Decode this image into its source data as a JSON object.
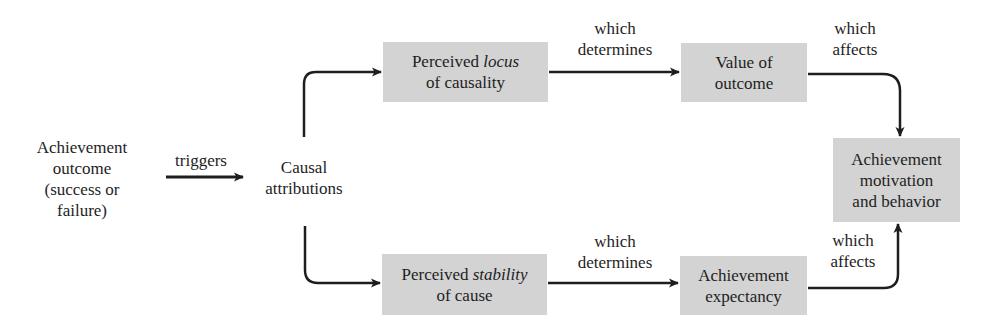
{
  "diagram": {
    "nodes": {
      "outcome": {
        "lines": [
          "Achievement",
          "outcome",
          "(success or",
          "failure)"
        ]
      },
      "attributions": {
        "lines": [
          "Causal",
          "attributions"
        ]
      },
      "locus": {
        "line1_prefix": "Perceived ",
        "line1_italic": "locus",
        "line2": "of causality"
      },
      "value": {
        "lines": [
          "Value of",
          "outcome"
        ]
      },
      "motivation": {
        "lines": [
          "Achievement",
          "motivation",
          "and behavior"
        ]
      },
      "stability": {
        "line1_prefix": "Perceived ",
        "line1_italic": "stability",
        "line2": "of cause"
      },
      "expectancy": {
        "lines": [
          "Achievement",
          "expectancy"
        ]
      }
    },
    "edges": {
      "triggers": "triggers",
      "top_determines": [
        "which",
        "determines"
      ],
      "top_affects": [
        "which",
        "affects"
      ],
      "bottom_determines": [
        "which",
        "determines"
      ],
      "bottom_affects": [
        "which",
        "affects"
      ]
    },
    "colors": {
      "box_fill": "#d3d3d3",
      "stroke": "#1e1e1e",
      "background": "#ffffff"
    }
  }
}
